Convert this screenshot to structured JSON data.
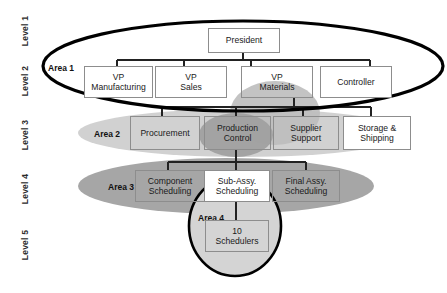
{
  "diagram": {
    "type": "org-chart",
    "levels": [
      {
        "id": "level-1",
        "label": "Level 1"
      },
      {
        "id": "level-2",
        "label": "Level 2"
      },
      {
        "id": "level-3",
        "label": "Level 3"
      },
      {
        "id": "level-4",
        "label": "Level 4"
      },
      {
        "id": "level-5",
        "label": "Level 5"
      }
    ],
    "areas": [
      {
        "id": "area-1",
        "label": "Area 1",
        "shape": "ellipse",
        "outline": "#000000",
        "fill": "none"
      },
      {
        "id": "area-2",
        "label": "Area 2",
        "shape": "ellipse",
        "outline": "none",
        "fill": "#cdcdcd"
      },
      {
        "id": "area-3",
        "label": "Area 3",
        "shape": "ellipse",
        "outline": "none",
        "fill": "#a3a3a3"
      },
      {
        "id": "area-4",
        "label": "Area 4",
        "shape": "ellipse",
        "outline": "#000000",
        "fill": "#d2d2d2"
      }
    ],
    "nodes": [
      {
        "id": "president",
        "label": "President",
        "level": "Level 1"
      },
      {
        "id": "vp-manufacturing",
        "label": "VP\nManufacturing",
        "level": "Level 2"
      },
      {
        "id": "vp-sales",
        "label": "VP\nSales",
        "level": "Level 2"
      },
      {
        "id": "vp-materials",
        "label": "VP\nMaterials",
        "level": "Level 2"
      },
      {
        "id": "controller",
        "label": "Controller",
        "level": "Level 2"
      },
      {
        "id": "procurement",
        "label": "Procurement",
        "level": "Level 3"
      },
      {
        "id": "production-control",
        "label": "Production\nControl",
        "level": "Level 3"
      },
      {
        "id": "supplier-support",
        "label": "Supplier\nSupport",
        "level": "Level 3"
      },
      {
        "id": "storage-shipping",
        "label": "Storage &\nShipping",
        "level": "Level 3"
      },
      {
        "id": "component-scheduling",
        "label": "Component\nScheduling",
        "level": "Level 4"
      },
      {
        "id": "sub-assy-scheduling",
        "label": "Sub-Assy.\nScheduling",
        "level": "Level 4"
      },
      {
        "id": "final-assy-scheduling",
        "label": "Final Assy.\nScheduling",
        "level": "Level 4"
      },
      {
        "id": "ten-schedulers",
        "label": "10\nSchedulers",
        "level": "Level 5"
      }
    ],
    "edges": [
      {
        "from": "president",
        "to": "vp-manufacturing"
      },
      {
        "from": "president",
        "to": "vp-sales"
      },
      {
        "from": "president",
        "to": "vp-materials"
      },
      {
        "from": "president",
        "to": "controller"
      },
      {
        "from": "vp-materials",
        "to": "procurement"
      },
      {
        "from": "vp-materials",
        "to": "production-control"
      },
      {
        "from": "vp-materials",
        "to": "supplier-support"
      },
      {
        "from": "vp-materials",
        "to": "storage-shipping"
      },
      {
        "from": "production-control",
        "to": "component-scheduling"
      },
      {
        "from": "production-control",
        "to": "sub-assy-scheduling"
      },
      {
        "from": "production-control",
        "to": "final-assy-scheduling"
      },
      {
        "from": "sub-assy-scheduling",
        "to": "ten-schedulers"
      }
    ],
    "colors": {
      "box_border": "#8d8d8d",
      "box_fill": "#ffffff",
      "connector": "#222222",
      "area1_outline": "#000000",
      "area2_fill": "#cdcdcd",
      "area3_fill": "#a3a3a3",
      "area4_fill": "#d2d2d2",
      "highlight_vp_materials": "#b5b5b5",
      "highlight_production_control": "#9a9a9a"
    }
  }
}
